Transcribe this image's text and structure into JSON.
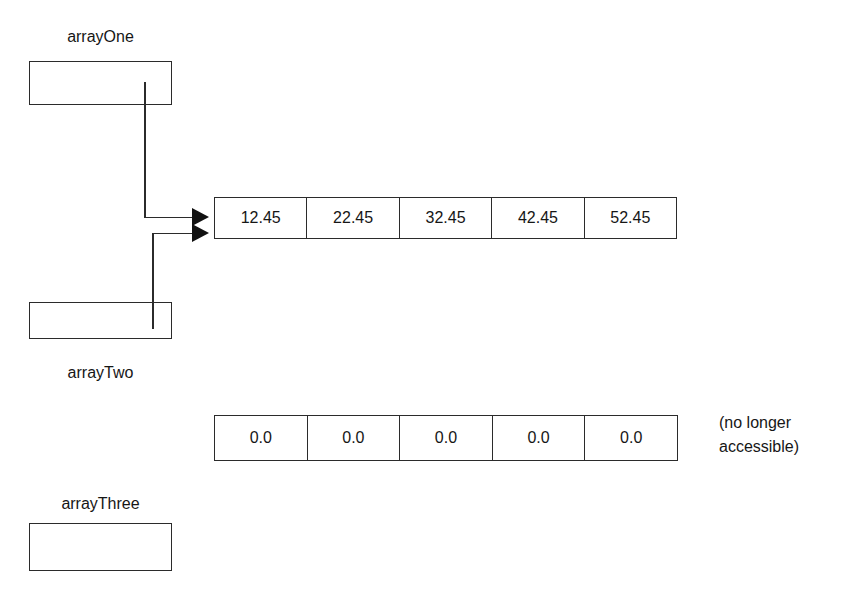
{
  "diagram": {
    "type": "memory-reference-diagram",
    "variables": [
      {
        "id": "arrayOne",
        "label": "arrayOne",
        "label_position": "above",
        "points_to": "array_values"
      },
      {
        "id": "arrayTwo",
        "label": "arrayTwo",
        "label_position": "below",
        "points_to": "array_values"
      },
      {
        "id": "arrayThree",
        "label": "arrayThree",
        "label_position": "above",
        "points_to": null
      }
    ],
    "arrays": [
      {
        "id": "array_values",
        "values": [
          "12.45",
          "22.45",
          "32.45",
          "42.45",
          "52.45"
        ],
        "referenced_by": [
          "arrayOne",
          "arrayTwo"
        ]
      },
      {
        "id": "array_orphan",
        "values": [
          "0.0",
          "0.0",
          "0.0",
          "0.0",
          "0.0"
        ],
        "referenced_by": [],
        "note_lines": [
          "(no longer",
          "accessible)"
        ]
      }
    ],
    "colors": {
      "stroke": "#2b2b2b",
      "arrow": "#111111",
      "text": "#161616",
      "background": "#ffffff"
    }
  }
}
